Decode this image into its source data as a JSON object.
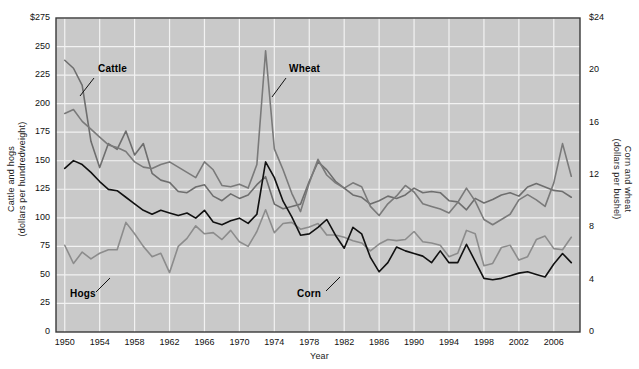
{
  "chart_data": {
    "type": "line",
    "title": "",
    "xlabel": "Year",
    "ylabel": "Cattle and hogs (dollars per hundredweight)",
    "ylabel_right": "Corn and wheat (dollars per bushel)",
    "grid": true,
    "legend_position": "inline-annotations",
    "xlim": [
      1949,
      2009
    ],
    "ylim": [
      0,
      275
    ],
    "ylim_right": [
      0,
      24
    ],
    "left_axis": {
      "title_line1": "Cattle and hogs",
      "title_line2": "(dollars per hundredweight)",
      "ticks": [
        0,
        25,
        50,
        75,
        100,
        125,
        150,
        175,
        200,
        225,
        250,
        275
      ],
      "tick_labels": [
        "0",
        "25",
        "50",
        "75",
        "100",
        "125",
        "150",
        "175",
        "200",
        "225",
        "250",
        "$275"
      ]
    },
    "right_axis": {
      "title_line1": "Corn and wheat",
      "title_line2": "(dollars per bushel)",
      "ticks": [
        0,
        4,
        8,
        12,
        16,
        20,
        24
      ],
      "tick_labels": [
        "0",
        "4",
        "8",
        "12",
        "16",
        "20",
        "$24"
      ]
    },
    "x_ticks": [
      1950,
      1954,
      1958,
      1962,
      1966,
      1970,
      1974,
      1978,
      1982,
      1986,
      1990,
      1994,
      1998,
      2002,
      2006
    ],
    "x_tick_labels": [
      "1950",
      "1954",
      "1958",
      "1962",
      "1966",
      "1970",
      "1974",
      "1978",
      "1982",
      "1986",
      "1990",
      "1994",
      "1998",
      "2002",
      "2006"
    ],
    "years": [
      1950,
      1951,
      1952,
      1953,
      1954,
      1955,
      1956,
      1957,
      1958,
      1959,
      1960,
      1961,
      1962,
      1963,
      1964,
      1965,
      1966,
      1967,
      1968,
      1969,
      1970,
      1971,
      1972,
      1973,
      1974,
      1975,
      1976,
      1977,
      1978,
      1979,
      1980,
      1981,
      1982,
      1983,
      1984,
      1985,
      1986,
      1987,
      1988,
      1989,
      1990,
      1991,
      1992,
      1993,
      1994,
      1995,
      1996,
      1997,
      1998,
      1999,
      2000,
      2001,
      2002,
      2003,
      2004,
      2005,
      2006,
      2007,
      2008
    ],
    "series": [
      {
        "name": "Cattle",
        "axis": "left",
        "color": "#6e6e6e",
        "values": [
          238,
          231,
          216,
          167,
          144,
          165,
          160,
          176,
          155,
          165,
          139,
          133,
          131,
          123,
          122,
          127,
          129,
          119,
          115,
          121,
          117,
          120,
          129,
          136,
          112,
          108,
          110,
          112,
          132,
          149,
          142,
          132,
          126,
          120,
          118,
          112,
          115,
          119,
          117,
          120,
          126,
          122,
          123,
          122,
          115,
          114,
          107,
          117,
          113,
          116,
          120,
          122,
          119,
          127,
          130,
          127,
          124,
          123,
          118
        ]
      },
      {
        "name": "Hogs",
        "axis": "left",
        "color": "#8c8c8c",
        "values": [
          76,
          60,
          70,
          64,
          69,
          72,
          72,
          96,
          86,
          75,
          66,
          69,
          52,
          75,
          82,
          93,
          86,
          87,
          81,
          89,
          79,
          75,
          88,
          107,
          87,
          95,
          96,
          90,
          92,
          95,
          85,
          85,
          83,
          80,
          78,
          71,
          77,
          81,
          80,
          81,
          88,
          79,
          78,
          76,
          66,
          69,
          89,
          86,
          58,
          60,
          74,
          76,
          63,
          66,
          81,
          84,
          73,
          72,
          83
        ]
      },
      {
        "name": "Wheat",
        "axis": "right",
        "color": "#7a7a7a",
        "values": [
          16.7,
          17.0,
          16.1,
          15.5,
          14.9,
          14.3,
          14.1,
          13.8,
          13.0,
          12.6,
          12.5,
          12.8,
          13.0,
          12.6,
          12.2,
          11.8,
          13.0,
          12.4,
          11.2,
          11.1,
          11.3,
          11.0,
          12.8,
          21.5,
          14.0,
          12.4,
          10.6,
          9.2,
          11.4,
          13.2,
          12.0,
          11.4,
          11.0,
          11.4,
          11.1,
          9.6,
          8.9,
          9.8,
          10.4,
          11.2,
          10.7,
          9.8,
          9.6,
          9.4,
          9.1,
          9.9,
          11.0,
          10.0,
          8.6,
          8.2,
          8.6,
          9.0,
          10.1,
          10.5,
          10.1,
          9.6,
          11.4,
          14.4,
          11.9
        ]
      },
      {
        "name": "Corn",
        "axis": "right",
        "color": "#111111",
        "values": [
          12.5,
          13.1,
          12.8,
          12.2,
          11.5,
          10.9,
          10.8,
          10.3,
          9.8,
          9.3,
          9.0,
          9.3,
          9.1,
          8.9,
          9.1,
          8.7,
          9.3,
          8.4,
          8.2,
          8.5,
          8.7,
          8.3,
          9.0,
          13.0,
          11.8,
          10.0,
          8.8,
          7.4,
          7.5,
          8.0,
          8.6,
          7.4,
          6.4,
          8.0,
          7.5,
          5.7,
          4.6,
          5.3,
          6.5,
          6.2,
          6.0,
          5.8,
          5.3,
          6.2,
          5.3,
          5.3,
          6.7,
          5.4,
          4.1,
          4.0,
          4.1,
          4.3,
          4.5,
          4.6,
          4.4,
          4.2,
          5.2,
          6.0,
          5.3
        ]
      }
    ],
    "annotations": [
      {
        "label": "Cattle",
        "x": 98,
        "y": 70,
        "leader": {
          "x1": 94,
          "y1": 78,
          "x2": 80,
          "y2": 96
        }
      },
      {
        "label": "Wheat",
        "x": 289,
        "y": 70,
        "leader": {
          "x1": 286,
          "y1": 78,
          "x2": 272,
          "y2": 97
        }
      },
      {
        "label": "Hogs",
        "x": 70,
        "y": 295,
        "leader": {
          "x1": 96,
          "y1": 292,
          "x2": 110,
          "y2": 278
        }
      },
      {
        "label": "Corn",
        "x": 297,
        "y": 295,
        "leader": {
          "x1": 326,
          "y1": 291,
          "x2": 340,
          "y2": 277
        }
      }
    ]
  }
}
